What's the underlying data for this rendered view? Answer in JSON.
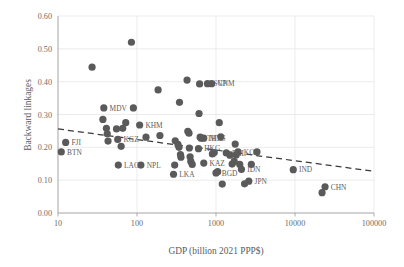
{
  "chart_data": {
    "type": "scatter",
    "title": "",
    "xlabel": "GDP (billion 2021 PPP$)",
    "ylabel": "Backward linkages",
    "xscale": "log",
    "yscale": "linear",
    "xlim": [
      10,
      100000
    ],
    "ylim": [
      0.0,
      0.6
    ],
    "xticks": [
      10,
      100,
      1000,
      10000,
      100000
    ],
    "xtick_labels": [
      "10",
      "100",
      "1000",
      "10000",
      "100000"
    ],
    "yticks": [
      0.0,
      0.1,
      0.2,
      0.3,
      0.4,
      0.5,
      0.6
    ],
    "ytick_labels": [
      "0.00",
      "0.10",
      "0.20",
      "0.30",
      "0.40",
      "0.50",
      "0.60"
    ],
    "grid": true,
    "legend": false,
    "marker_color": "#5a5a5a",
    "marker_size": 4,
    "points": [
      {
        "label": "BTN",
        "label_side": "right",
        "x": 11,
        "y": 0.186
      },
      {
        "label": "FJI",
        "label_side": "right",
        "x": 12.5,
        "y": 0.215
      },
      {
        "label": "",
        "label_side": "none",
        "x": 27,
        "y": 0.444
      },
      {
        "label": "",
        "label_side": "none",
        "x": 37,
        "y": 0.285
      },
      {
        "label": "MDV",
        "label_side": "right",
        "x": 38,
        "y": 0.32
      },
      {
        "label": "",
        "label_side": "none",
        "x": 41,
        "y": 0.258
      },
      {
        "label": "",
        "label_side": "none",
        "x": 42,
        "y": 0.241
      },
      {
        "label": "",
        "label_side": "none",
        "x": 43,
        "y": 0.219
      },
      {
        "label": "",
        "label_side": "none",
        "x": 55,
        "y": 0.256
      },
      {
        "label": "KGZ",
        "label_side": "right",
        "x": 57,
        "y": 0.224
      },
      {
        "label": "LAO",
        "label_side": "right",
        "x": 58,
        "y": 0.146
      },
      {
        "label": "",
        "label_side": "none",
        "x": 63,
        "y": 0.203
      },
      {
        "label": "",
        "label_side": "none",
        "x": 66,
        "y": 0.258
      },
      {
        "label": "",
        "label_side": "none",
        "x": 72,
        "y": 0.275
      },
      {
        "label": "",
        "label_side": "none",
        "x": 85,
        "y": 0.52
      },
      {
        "label": "",
        "label_side": "none",
        "x": 90,
        "y": 0.32
      },
      {
        "label": "KHM",
        "label_side": "right",
        "x": 108,
        "y": 0.268
      },
      {
        "label": "NPL",
        "label_side": "right",
        "x": 112,
        "y": 0.146
      },
      {
        "label": "",
        "label_side": "none",
        "x": 130,
        "y": 0.231
      },
      {
        "label": "",
        "label_side": "none",
        "x": 185,
        "y": 0.375
      },
      {
        "label": "",
        "label_side": "none",
        "x": 195,
        "y": 0.236
      },
      {
        "label": "LKA",
        "label_side": "right",
        "x": 290,
        "y": 0.118
      },
      {
        "label": "",
        "label_side": "none",
        "x": 300,
        "y": 0.146
      },
      {
        "label": "",
        "label_side": "none",
        "x": 305,
        "y": 0.22
      },
      {
        "label": "",
        "label_side": "none",
        "x": 330,
        "y": 0.209
      },
      {
        "label": "",
        "label_side": "none",
        "x": 340,
        "y": 0.2
      },
      {
        "label": "",
        "label_side": "none",
        "x": 345,
        "y": 0.337
      },
      {
        "label": "",
        "label_side": "none",
        "x": 355,
        "y": 0.178
      },
      {
        "label": "",
        "label_side": "none",
        "x": 360,
        "y": 0.17
      },
      {
        "label": "",
        "label_side": "none",
        "x": 430,
        "y": 0.405
      },
      {
        "label": "",
        "label_side": "none",
        "x": 440,
        "y": 0.249
      },
      {
        "label": "",
        "label_side": "none",
        "x": 455,
        "y": 0.243
      },
      {
        "label": "",
        "label_side": "none",
        "x": 460,
        "y": 0.198
      },
      {
        "label": "",
        "label_side": "none",
        "x": 470,
        "y": 0.171
      },
      {
        "label": "",
        "label_side": "none",
        "x": 480,
        "y": 0.157
      },
      {
        "label": "",
        "label_side": "none",
        "x": 500,
        "y": 0.148
      },
      {
        "label": "HKG",
        "label_side": "right",
        "x": 600,
        "y": 0.196
      },
      {
        "label": "",
        "label_side": "none",
        "x": 610,
        "y": 0.303
      },
      {
        "label": "",
        "label_side": "none",
        "x": 620,
        "y": 0.393
      },
      {
        "label": "",
        "label_side": "none",
        "x": 630,
        "y": 0.231
      },
      {
        "label": "THA",
        "label_side": "right",
        "x": 650,
        "y": 0.228
      },
      {
        "label": "MYS",
        "label_side": "right",
        "x": 700,
        "y": 0.228
      },
      {
        "label": "KAZ",
        "label_side": "right",
        "x": 700,
        "y": 0.152
      },
      {
        "label": "SGP",
        "label_side": "right",
        "x": 780,
        "y": 0.394
      },
      {
        "label": "VNM",
        "label_side": "right",
        "x": 880,
        "y": 0.394
      },
      {
        "label": "",
        "label_side": "none",
        "x": 900,
        "y": 0.18
      },
      {
        "label": "",
        "label_side": "none",
        "x": 950,
        "y": 0.184
      },
      {
        "label": "BGD",
        "label_side": "right",
        "x": 1000,
        "y": 0.122
      },
      {
        "label": "",
        "label_side": "none",
        "x": 1050,
        "y": 0.126
      },
      {
        "label": "",
        "label_side": "none",
        "x": 1100,
        "y": 0.275
      },
      {
        "label": "",
        "label_side": "none",
        "x": 1150,
        "y": 0.232
      },
      {
        "label": "",
        "label_side": "none",
        "x": 1200,
        "y": 0.088
      },
      {
        "label": "PHL",
        "label_side": "right",
        "x": 1350,
        "y": 0.183
      },
      {
        "label": "",
        "label_side": "none",
        "x": 1500,
        "y": 0.176
      },
      {
        "label": "",
        "label_side": "none",
        "x": 1600,
        "y": 0.149
      },
      {
        "label": "",
        "label_side": "none",
        "x": 1700,
        "y": 0.157
      },
      {
        "label": "",
        "label_side": "none",
        "x": 1750,
        "y": 0.21
      },
      {
        "label": "",
        "label_side": "none",
        "x": 1800,
        "y": 0.177
      },
      {
        "label": "KOR",
        "label_side": "right",
        "x": 1900,
        "y": 0.186
      },
      {
        "label": "",
        "label_side": "none",
        "x": 2000,
        "y": 0.148
      },
      {
        "label": "IDN",
        "label_side": "right",
        "x": 2100,
        "y": 0.133
      },
      {
        "label": "",
        "label_side": "none",
        "x": 2300,
        "y": 0.089
      },
      {
        "label": "JPN",
        "label_side": "right",
        "x": 2600,
        "y": 0.097
      },
      {
        "label": "",
        "label_side": "none",
        "x": 2800,
        "y": 0.148
      },
      {
        "label": "",
        "label_side": "none",
        "x": 3300,
        "y": 0.186
      },
      {
        "label": "IND",
        "label_side": "right",
        "x": 9500,
        "y": 0.132
      },
      {
        "label": "CHN",
        "label_side": "right",
        "x": 24000,
        "y": 0.08
      },
      {
        "label": "",
        "label_side": "none",
        "x": 22000,
        "y": 0.062
      }
    ],
    "trendline": {
      "style": "dashed",
      "color": "#3a3a3a",
      "x_start": 10,
      "y_start": 0.256,
      "x_end": 100000,
      "y_end": 0.127
    }
  }
}
